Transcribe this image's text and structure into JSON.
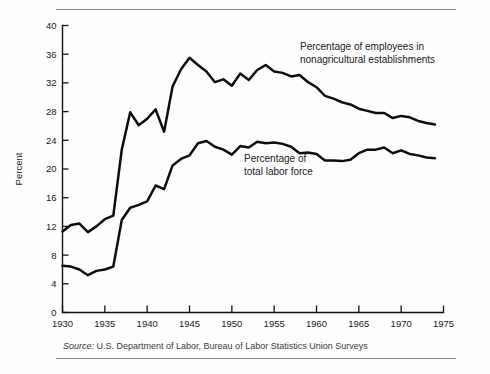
{
  "figure": {
    "source_label": "Source:",
    "source_text": "U.S. Department of Labor, Bureau of Labor Statistics Union Surveys",
    "annotation_upper": "Percentage of employees in\nnonagricultural establishments",
    "annotation_lower": "Percentage of\ntotal labor force",
    "ink_color": "#0d0d0d",
    "rule_color": "#8d8d8d"
  },
  "chart_data": {
    "type": "line",
    "title": "",
    "xlabel": "",
    "ylabel": "Percent",
    "xlim": [
      1930,
      1975
    ],
    "ylim": [
      0,
      40
    ],
    "xticks": [
      1930,
      1935,
      1940,
      1945,
      1950,
      1955,
      1960,
      1965,
      1970,
      1975
    ],
    "yticks": [
      0,
      4,
      8,
      12,
      16,
      20,
      24,
      28,
      32,
      36,
      40
    ],
    "grid": false,
    "legend": "annotations-inline",
    "x": [
      1930,
      1931,
      1932,
      1933,
      1934,
      1935,
      1936,
      1937,
      1938,
      1939,
      1940,
      1941,
      1942,
      1943,
      1944,
      1945,
      1946,
      1947,
      1948,
      1949,
      1950,
      1951,
      1952,
      1953,
      1954,
      1955,
      1956,
      1957,
      1958,
      1959,
      1960,
      1961,
      1962,
      1963,
      1964,
      1965,
      1966,
      1967,
      1968,
      1969,
      1970,
      1971,
      1972,
      1973,
      1974
    ],
    "series": [
      {
        "name": "Percentage of employees in nonagricultural establishments",
        "values": [
          11.3,
          12.2,
          12.4,
          11.2,
          12.0,
          13.0,
          13.5,
          22.7,
          27.9,
          26.1,
          27.0,
          28.3,
          25.2,
          31.5,
          33.9,
          35.5,
          34.5,
          33.6,
          32.1,
          32.5,
          31.6,
          33.3,
          32.4,
          33.8,
          34.5,
          33.6,
          33.4,
          32.9,
          33.1,
          32.1,
          31.4,
          30.2,
          29.8,
          29.3,
          29.0,
          28.4,
          28.1,
          27.8,
          27.8,
          27.1,
          27.4,
          27.2,
          26.7,
          26.4,
          26.2
        ]
      },
      {
        "name": "Percentage of total labor force",
        "values": [
          6.5,
          6.4,
          6.0,
          5.2,
          5.8,
          6.0,
          6.4,
          12.9,
          14.6,
          15.0,
          15.5,
          17.7,
          17.2,
          20.5,
          21.4,
          21.9,
          23.6,
          23.9,
          23.1,
          22.7,
          22.0,
          23.2,
          23.0,
          23.8,
          23.6,
          23.7,
          23.5,
          23.1,
          22.2,
          22.3,
          22.1,
          21.2,
          21.2,
          21.1,
          21.3,
          22.2,
          22.7,
          22.7,
          23.0,
          22.2,
          22.6,
          22.1,
          21.9,
          21.6,
          21.5
        ]
      }
    ]
  }
}
